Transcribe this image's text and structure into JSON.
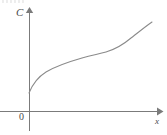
{
  "figure": {
    "kind": "cost-function-graph",
    "background_color": "#ffffff",
    "axis_color": "#7b7b7b",
    "curve_color": "#8a8a8a",
    "label_color": "#4a4a4a",
    "y_axis_label": "C",
    "x_axis_label": "x",
    "origin_label": "0",
    "top_artifact_note": ""
  },
  "chart_data": {
    "type": "line",
    "title": "",
    "xlabel": "x",
    "ylabel": "C",
    "grid": false,
    "legend": false,
    "axes": {
      "x_axis": {
        "pixel_y": 111,
        "pixel_x_start": 0,
        "pixel_x_end": 160,
        "arrow": true,
        "tick_labels": []
      },
      "y_axis": {
        "pixel_x": 29,
        "pixel_y_top": 9,
        "pixel_y_bottom": 131,
        "arrow": true,
        "tick_labels": []
      }
    },
    "series": [
      {
        "name": "C(x)",
        "description": "cost curve: rises steeply, concave down, inflects near the middle, then rises steeply concave up",
        "points_pixel": [
          [
            29,
            93
          ],
          [
            33,
            84
          ],
          [
            38,
            78
          ],
          [
            44,
            73
          ],
          [
            52,
            68
          ],
          [
            61,
            64
          ],
          [
            71,
            60
          ],
          [
            82,
            57
          ],
          [
            93,
            55
          ],
          [
            104,
            53
          ],
          [
            113,
            50
          ],
          [
            121,
            47
          ],
          [
            128,
            43
          ],
          [
            135,
            38
          ],
          [
            141,
            33
          ],
          [
            147,
            28
          ],
          [
            152,
            22
          ]
        ],
        "path_d": "M 29 93 C 33 83, 38 77, 46 72 C 56 66, 68 62, 82 58 C 93 55, 99 54, 106 52 C 116 49, 124 44, 131 38 C 139 32, 146 26, 152 22"
      }
    ],
    "annotations": [
      {
        "name": "origin",
        "text": "0",
        "pixel": [
          22,
          117
        ]
      },
      {
        "name": "y-axis-name",
        "text": "C",
        "pixel": [
          20,
          13
        ]
      },
      {
        "name": "x-axis-name",
        "text": "x",
        "pixel": [
          158,
          121
        ]
      }
    ]
  }
}
